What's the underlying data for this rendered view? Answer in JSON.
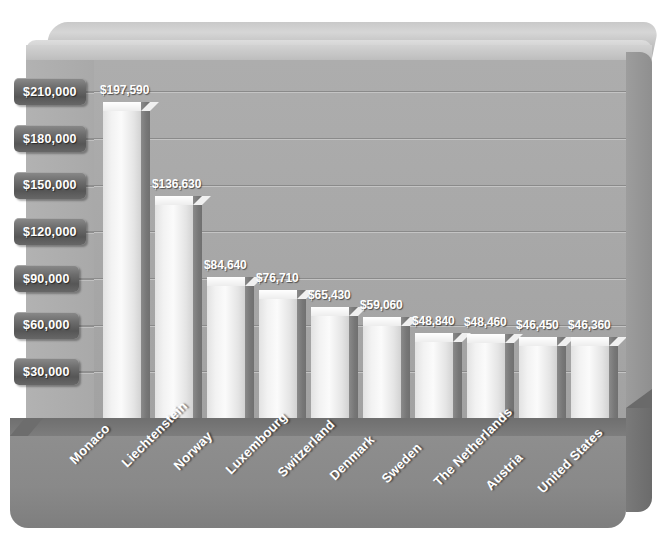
{
  "chart_data": {
    "type": "bar",
    "title": "",
    "subtitle": "",
    "xlabel": "",
    "ylabel": "",
    "categories": [
      "Monaco",
      "Liechtenstein",
      "Norway",
      "Luxembourg",
      "Switzerland",
      "Denmark",
      "Sweden",
      "The Netherlands",
      "Austria",
      "United States"
    ],
    "values": [
      197590,
      136630,
      84640,
      76710,
      65430,
      59060,
      48840,
      48460,
      46450,
      46360
    ],
    "value_labels": [
      "$197,590",
      "$136,630",
      "$84,640",
      "$76,710",
      "$65,430",
      "$59,060",
      "$48,840",
      "$48,460",
      "$46,450",
      "$46,360"
    ],
    "ylim": [
      0,
      225000
    ],
    "ytick_values": [
      30000,
      60000,
      90000,
      120000,
      150000,
      180000,
      210000
    ],
    "ytick_labels": [
      "$30,000",
      "$60,000",
      "$90,000",
      "$120,000",
      "$150,000",
      "$180,000",
      "$210,000"
    ],
    "grid": true,
    "legend": "none",
    "style": "3d-bar",
    "colors": {
      "bar_front": "#f4f4f4",
      "bar_side": "#787878",
      "panel_background": "#a9a9a9",
      "base": "#8a8a8a",
      "axis_tab": "#5e5e5e",
      "label_text": "#ffffff",
      "gridline": "#8a8a8a",
      "page_background": "#ffffff"
    }
  }
}
